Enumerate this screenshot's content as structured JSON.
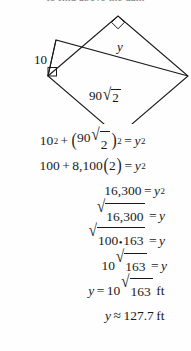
{
  "header": {
    "cropped_text": "to find above the dam"
  },
  "figure": {
    "label_left_side": "10",
    "label_hypotenuse": "y",
    "label_base_number": "90",
    "label_base_radicand": "2",
    "right_angle_markers": 2,
    "shape": "rotated-square-with-inscribed-right-triangle",
    "stroke_color": "#1a1a1a"
  },
  "solution": {
    "lines": [
      {
        "id": "pythagorean-setup",
        "text": "10² + (90√2)² = y²",
        "align": "center"
      },
      {
        "id": "expand-squares",
        "text": "100 + 8,100(2) = y²",
        "align": "center"
      },
      {
        "id": "sum-value",
        "text": "16,300 = y²",
        "align": "right"
      },
      {
        "id": "take-square-root",
        "text": "√16,300 = y",
        "align": "right"
      },
      {
        "id": "factor-radicand",
        "text": "√100•163 = y",
        "align": "right"
      },
      {
        "id": "simplify-radical",
        "text": "10√163 = y",
        "align": "right"
      },
      {
        "id": "exact-answer",
        "text": "y = 10√163 ft",
        "align": "right"
      },
      {
        "id": "approximate-answer",
        "text": "y ≈ 127.7 ft",
        "align": "right"
      }
    ],
    "numbers": {
      "ten": "10",
      "one_hundred": "100",
      "eighty_one_hundred": "8,100",
      "two": "2",
      "sixteen_thousand_three_hundred": "16,300",
      "one_sixty_three": "163",
      "ninety": "90",
      "approx_value": "127.7"
    },
    "units": "ft",
    "variable": "y",
    "approx_symbol": "≈",
    "equals_symbol": "=",
    "plus_symbol": "+",
    "multiply_dot": "•"
  }
}
